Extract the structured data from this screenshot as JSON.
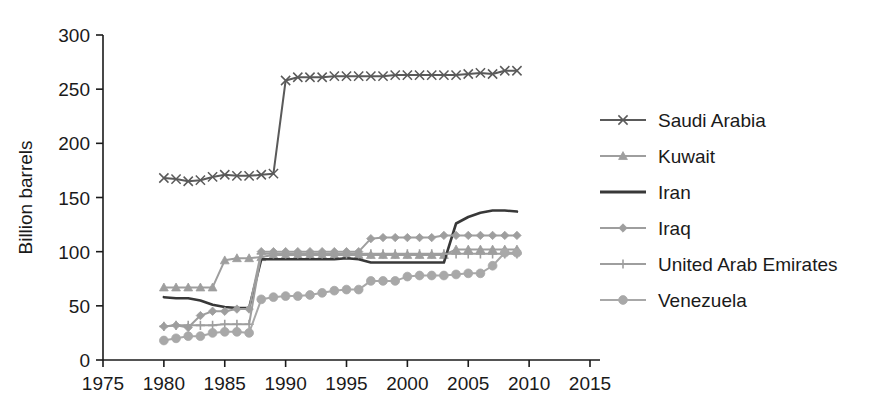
{
  "chart_data": {
    "type": "line",
    "title": "",
    "xlabel": "",
    "ylabel": "Billion barrels",
    "xlim": [
      1975,
      2015
    ],
    "ylim": [
      0,
      300
    ],
    "xticks": [
      1975,
      1980,
      1985,
      1990,
      1995,
      2000,
      2005,
      2010,
      2015
    ],
    "yticks": [
      0,
      50,
      100,
      150,
      200,
      250,
      300
    ],
    "grid": false,
    "legend_position": "right",
    "x": [
      1980,
      1981,
      1982,
      1983,
      1984,
      1985,
      1986,
      1987,
      1988,
      1989,
      1990,
      1991,
      1992,
      1993,
      1994,
      1995,
      1996,
      1997,
      1998,
      1999,
      2000,
      2001,
      2002,
      2003,
      2004,
      2005,
      2006,
      2007,
      2008,
      2009
    ],
    "series": [
      {
        "name": "Saudi Arabia",
        "marker": "x",
        "color": "#5a5a5a",
        "values": [
          168,
          167,
          165,
          166,
          169,
          171,
          170,
          170,
          171,
          172,
          258,
          261,
          261,
          261,
          262,
          262,
          262,
          262,
          262,
          263,
          263,
          263,
          263,
          263,
          263,
          264,
          265,
          264,
          267,
          267
        ]
      },
      {
        "name": "Kuwait",
        "marker": "triangle",
        "color": "#9e9e9e",
        "values": [
          67,
          67,
          67,
          67,
          67,
          92,
          94,
          94,
          95,
          97,
          97,
          97,
          97,
          97,
          97,
          97,
          97,
          97,
          97,
          97,
          97,
          97,
          97,
          97,
          102,
          102,
          102,
          102,
          102,
          102
        ]
      },
      {
        "name": "Iran",
        "marker": "none",
        "color": "#383838",
        "values": [
          58,
          57,
          57,
          55,
          51,
          49,
          48,
          48,
          93,
          93,
          93,
          93,
          93,
          93,
          93,
          94,
          93,
          90,
          90,
          90,
          90,
          90,
          90,
          90,
          126,
          132,
          136,
          138,
          138,
          137
        ]
      },
      {
        "name": "Iraq",
        "marker": "diamond",
        "color": "#9e9e9e",
        "values": [
          31,
          32,
          30,
          41,
          45,
          45,
          47,
          47,
          100,
          100,
          100,
          100,
          100,
          100,
          100,
          100,
          100,
          112,
          113,
          113,
          113,
          113,
          113,
          115,
          115,
          115,
          115,
          115,
          115,
          115
        ]
      },
      {
        "name": "United Arab Emirates",
        "marker": "plus",
        "color": "#9e9e9e",
        "values": [
          31,
          32,
          32,
          32,
          32,
          33,
          33,
          33,
          98,
          98,
          98,
          98,
          98,
          98,
          98,
          98,
          98,
          98,
          98,
          98,
          98,
          98,
          98,
          98,
          98,
          98,
          98,
          98,
          98,
          98
        ]
      },
      {
        "name": "Venezuela",
        "marker": "circle",
        "color": "#a8a8a8",
        "values": [
          18,
          20,
          22,
          22,
          25,
          26,
          26,
          25,
          56,
          58,
          59,
          59,
          60,
          62,
          64,
          65,
          65,
          73,
          73,
          73,
          77,
          78,
          78,
          78,
          79,
          80,
          80,
          87,
          99,
          99
        ]
      }
    ]
  },
  "legend": {
    "items": [
      {
        "label": "Saudi Arabia"
      },
      {
        "label": "Kuwait"
      },
      {
        "label": "Iran"
      },
      {
        "label": "Iraq"
      },
      {
        "label": "United Arab Emirates"
      },
      {
        "label": "Venezuela"
      }
    ]
  }
}
